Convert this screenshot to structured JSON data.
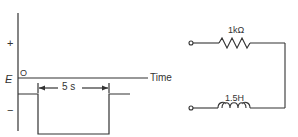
{
  "waveform": {
    "y_axis_positive": "+",
    "y_axis_negative": "−",
    "level_label": "E",
    "origin_label": "O",
    "x_axis_label": "Time",
    "pulse_duration_label": "5 s"
  },
  "circuit": {
    "resistor_label": "1kΩ",
    "inductor_label": "1.5H"
  },
  "colors": {
    "line": "#333333",
    "background": "#ffffff"
  }
}
